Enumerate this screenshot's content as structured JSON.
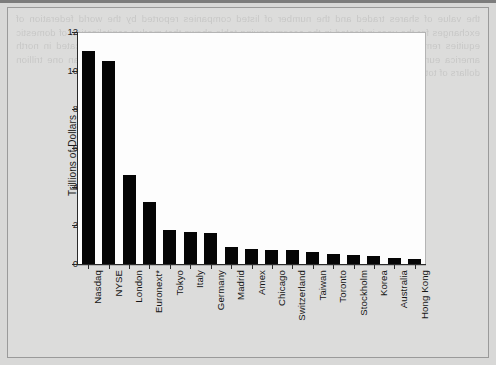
{
  "page": {
    "bleed_text": "the value of shares traded and the number of listed companies reported by the world federation of exchanges for the year indicated in the accompanying table shows that market capitalization of domestic equities remains concentrated among a relatively small number of major exchanges located in north america europe and east asia while the remaining exchanges each account for less than one trillion dollars of total domestic market capitalization at year end"
  },
  "chart_data": {
    "type": "bar",
    "title": "",
    "xlabel": "",
    "ylabel": "Trillions of Dollars",
    "ylim": [
      0,
      12
    ],
    "yticks": [
      0,
      2,
      4,
      6,
      8,
      10,
      12
    ],
    "ytick_labels": [
      "0",
      "2",
      "4",
      "6",
      "8",
      "10",
      "12"
    ],
    "grid": false,
    "legend": false,
    "bar_color": "#050505",
    "plot_background": "#fdfdfd",
    "categories": [
      "Nasdaq",
      "NYSE",
      "London",
      "Euronext*",
      "Tokyo",
      "Italy",
      "Germany",
      "Madrid",
      "Amex",
      "Chicago",
      "Switzerland",
      "Taiwan",
      "Toronto",
      "Stockholm",
      "Korea",
      "Australia",
      "Hong Kong"
    ],
    "values": [
      11.0,
      10.5,
      4.6,
      3.2,
      1.75,
      1.65,
      1.6,
      0.9,
      0.8,
      0.75,
      0.7,
      0.6,
      0.5,
      0.45,
      0.4,
      0.3,
      0.28
    ]
  }
}
